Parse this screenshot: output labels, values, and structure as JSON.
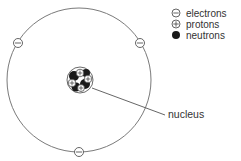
{
  "legend": {
    "items": [
      {
        "symbol": "minus-circle",
        "label": "electrons"
      },
      {
        "symbol": "plus-circle",
        "label": "protons"
      },
      {
        "symbol": "filled-circle",
        "label": "neutrons"
      }
    ]
  },
  "labels": {
    "nucleus": "nucleus"
  },
  "colors": {
    "line": "#6a6a6a",
    "neutron": "#1a1a1a",
    "text": "#333333"
  }
}
